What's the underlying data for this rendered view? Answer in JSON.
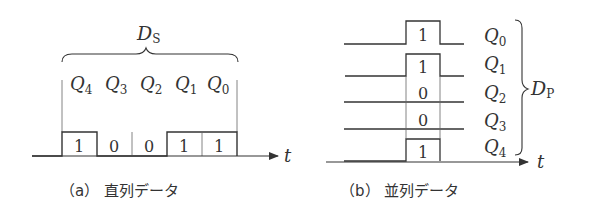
{
  "serial": {
    "group_label": "D",
    "group_label_sub": "S",
    "bit_labels": [
      {
        "name": "Q",
        "sub": "4"
      },
      {
        "name": "Q",
        "sub": "3"
      },
      {
        "name": "Q",
        "sub": "2"
      },
      {
        "name": "Q",
        "sub": "1"
      },
      {
        "name": "Q",
        "sub": "0"
      }
    ],
    "bit_values": [
      "1",
      "0",
      "0",
      "1",
      "1"
    ],
    "axis_label": "t",
    "caption": "（a） 直列データ"
  },
  "parallel": {
    "group_label": "D",
    "group_label_sub": "P",
    "rows": [
      {
        "name": "Q",
        "sub": "0",
        "value": "1"
      },
      {
        "name": "Q",
        "sub": "1",
        "value": "1"
      },
      {
        "name": "Q",
        "sub": "2",
        "value": "0"
      },
      {
        "name": "Q",
        "sub": "3",
        "value": "0"
      },
      {
        "name": "Q",
        "sub": "4",
        "value": "1"
      }
    ],
    "axis_label": "t",
    "caption": "（b） 並列データ"
  },
  "colors": {
    "line": "#333333",
    "background": "#ffffff"
  }
}
